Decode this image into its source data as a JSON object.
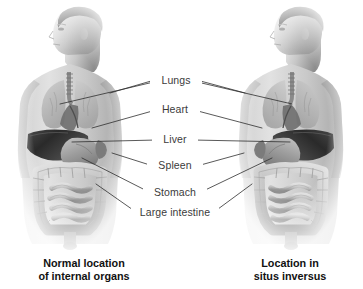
{
  "image": {
    "title": "Normal location of internal organs versus situs inversus",
    "background_color": "#ffffff",
    "width": 363,
    "height": 289
  },
  "labels": {
    "lungs": "Lungs",
    "heart": "Heart",
    "liver": "Liver",
    "spleen": "Spleen",
    "stomach": "Stomach",
    "large_intestine": "Large intestine"
  },
  "captions": {
    "left": {
      "line1": "Normal location",
      "line2": "of internal organs"
    },
    "right": {
      "line1": "Location in",
      "line2": "situs inversus"
    }
  },
  "colors": {
    "label_text": "#3b3b3b",
    "caption_text": "#111111",
    "leader_line": "#2e2e2e",
    "skin_light": "#d9d9d9",
    "skin_mid": "#b8b8b8",
    "skin_dark": "#8f8f8f",
    "liver_dark": "#2b2b2b",
    "stomach_gray": "#a9a9a9",
    "intestine_gray": "#c4c4c4",
    "lung_gray": "#bdbdbd"
  },
  "figures": [
    {
      "name": "normal-anatomy-figure",
      "side": "left",
      "organ_arrangement": "normal",
      "liver_side": "viewer-left",
      "stomach_side": "viewer-right"
    },
    {
      "name": "situs-inversus-figure",
      "side": "right",
      "organ_arrangement": "mirrored",
      "liver_side": "viewer-right",
      "stomach_side": "viewer-left"
    }
  ],
  "organ_list": [
    "Lungs",
    "Heart",
    "Liver",
    "Spleen",
    "Stomach",
    "Large intestine"
  ]
}
